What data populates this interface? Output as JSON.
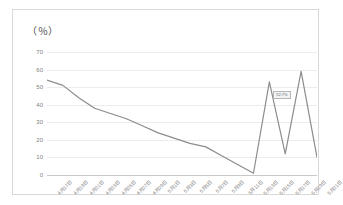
{
  "chart": {
    "axis_title": "（％）",
    "tooltip_label": "52.7%"
  },
  "chart_data": {
    "type": "line",
    "title": "（％）",
    "subtitle": "",
    "xlabel": "",
    "ylabel": "（％）",
    "ylim": [
      0,
      70
    ],
    "yticks": [
      0,
      10,
      20,
      30,
      40,
      50,
      60,
      70
    ],
    "grid": true,
    "legend": false,
    "legend_position": "none",
    "categories": [
      "4月17日",
      "4月19日",
      "4月21日",
      "4月23日",
      "4月25日",
      "4月27日",
      "4月29日",
      "5月1日",
      "5月3日",
      "5月5日",
      "5月7日",
      "5月9日",
      "5月11日",
      "5月13日",
      "5月15日",
      "5月17日",
      "5月19日",
      "5月21日"
    ],
    "values": [
      54,
      51,
      44,
      38,
      35,
      32,
      28,
      24,
      21,
      18,
      16,
      11,
      6,
      1,
      53,
      12,
      59,
      10
    ],
    "annotations": [
      {
        "text": "52.7%",
        "x_index": 15,
        "y_value": 45
      }
    ]
  }
}
